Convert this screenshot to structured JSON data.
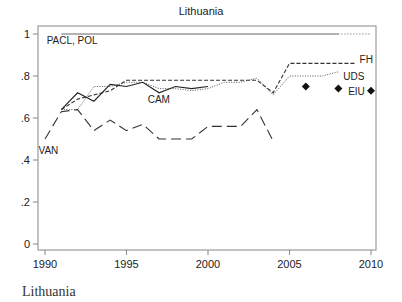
{
  "chart_data": {
    "type": "line",
    "title": "Lithuania",
    "xlabel": "",
    "ylabel": "",
    "xlim": [
      1990,
      2010
    ],
    "ylim": [
      0,
      1
    ],
    "x_ticks": [
      "1990",
      "1995",
      "2000",
      "2005",
      "2010"
    ],
    "y_ticks": [
      "0",
      ".2",
      ".4",
      ".6",
      ".8",
      "1"
    ],
    "grid": false,
    "series": [
      {
        "name": "PACL, POL",
        "style": "solid-then-dotted",
        "x": [
          1991,
          2008,
          2010
        ],
        "values": [
          1.0,
          1.0,
          1.0
        ]
      },
      {
        "name": "FH",
        "style": "short-dash",
        "x": [
          1991,
          1992,
          1993,
          1994,
          1995,
          1996,
          1997,
          1998,
          1999,
          2000,
          2001,
          2002,
          2003,
          2004,
          2005,
          2006,
          2007,
          2008,
          2009
        ],
        "values": [
          0.64,
          0.69,
          0.71,
          0.73,
          0.78,
          0.78,
          0.78,
          0.78,
          0.78,
          0.78,
          0.78,
          0.78,
          0.78,
          0.72,
          0.86,
          0.86,
          0.86,
          0.86,
          0.86
        ]
      },
      {
        "name": "UDS",
        "style": "dash-dot",
        "x": [
          1991,
          1992,
          1993,
          1994,
          1995,
          1996,
          1997,
          1998,
          1999,
          2000,
          2001,
          2002,
          2003,
          2004,
          2005,
          2006,
          2007,
          2008
        ],
        "values": [
          0.64,
          0.64,
          0.75,
          0.75,
          0.77,
          0.77,
          0.74,
          0.74,
          0.73,
          0.74,
          0.77,
          0.77,
          0.79,
          0.71,
          0.8,
          0.8,
          0.8,
          0.82
        ]
      },
      {
        "name": "CAM",
        "style": "solid",
        "x": [
          1991,
          1992,
          1993,
          1994,
          1995,
          1996,
          1997,
          1998,
          1999,
          2000
        ],
        "values": [
          0.64,
          0.72,
          0.68,
          0.76,
          0.75,
          0.77,
          0.72,
          0.75,
          0.74,
          0.75
        ]
      },
      {
        "name": "VAN",
        "style": "long-dash",
        "x": [
          1990,
          1991,
          1992,
          1993,
          1994,
          1995,
          1996,
          1997,
          1998,
          1999,
          2000,
          2001,
          2002,
          2003,
          2004
        ],
        "values": [
          0.5,
          0.63,
          0.64,
          0.54,
          0.59,
          0.54,
          0.57,
          0.5,
          0.5,
          0.5,
          0.56,
          0.56,
          0.56,
          0.64,
          0.49
        ]
      },
      {
        "name": "EIU",
        "style": "diamond-markers",
        "x": [
          2006,
          2008,
          2010
        ],
        "values": [
          0.75,
          0.74,
          0.73
        ]
      }
    ],
    "annotations": [
      {
        "text": "PACL, POL",
        "x": 1990.1,
        "y": 0.97
      },
      {
        "text": "FH",
        "x": 2009.3,
        "y": 0.88
      },
      {
        "text": "UDS",
        "x": 2008.3,
        "y": 0.8
      },
      {
        "text": "EIU",
        "x": 2008.6,
        "y": 0.73
      },
      {
        "text": "CAM",
        "x": 1996.3,
        "y": 0.69
      },
      {
        "text": "VAN",
        "x": 1989.6,
        "y": 0.45
      }
    ]
  },
  "caption": "Lithuania"
}
